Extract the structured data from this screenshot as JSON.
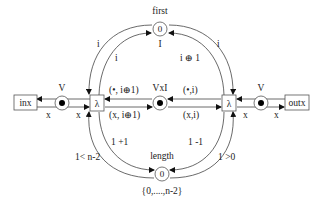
{
  "diagram": {
    "type": "petri-net",
    "places": {
      "first": {
        "label": "first",
        "token": "0",
        "type_label": "I"
      },
      "length": {
        "label": "length",
        "token": "0",
        "type_label": "{0,....,n-2}"
      },
      "center": {
        "label": "VxI"
      },
      "left_v": {
        "label": "V"
      },
      "right_v": {
        "label": "V"
      }
    },
    "transitions": {
      "left": {
        "label": "λ"
      },
      "right": {
        "label": "λ"
      }
    },
    "ports": {
      "inx": {
        "label": "inx"
      },
      "outx": {
        "label": "outx"
      }
    },
    "arc_labels": {
      "first_to_left_outer": "i",
      "first_to_left_inner": "i",
      "first_to_right_outer": "i",
      "right_to_first": "i ⊕ 1",
      "center_to_left_top": "(•, i⊕1)",
      "left_to_center_bottom": "(x, i⊕1)",
      "right_to_center_top": "(•,i)",
      "center_to_right_bottom": "(x,i)",
      "left_to_inx": "x",
      "leftv_to_left": "x",
      "right_to_rightv": "x",
      "rightv_to_outx": "x",
      "left_to_length": "1 +1",
      "length_to_left": "1< n-2",
      "right_to_length": "1 -1",
      "length_to_right": "1 >0"
    }
  }
}
